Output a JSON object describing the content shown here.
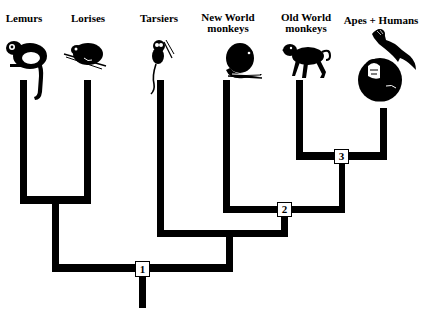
{
  "taxa": [
    {
      "id": "lemurs",
      "label": "Lemurs"
    },
    {
      "id": "lorises",
      "label": "Lorises"
    },
    {
      "id": "tarsiers",
      "label": "Tarsiers"
    },
    {
      "id": "new-world-monkeys",
      "label_line1": "New World",
      "label_line2": "monkeys"
    },
    {
      "id": "old-world-monkeys",
      "label_line1": "Old World",
      "label_line2": "monkeys"
    },
    {
      "id": "apes-humans",
      "label": "Apes + Humans"
    }
  ],
  "nodes": [
    {
      "id": "node-1",
      "label": "1"
    },
    {
      "id": "node-2",
      "label": "2"
    },
    {
      "id": "node-3",
      "label": "3"
    }
  ],
  "colors": {
    "line": "#000000",
    "background": "#ffffff",
    "node_fill": "#ffffff"
  }
}
